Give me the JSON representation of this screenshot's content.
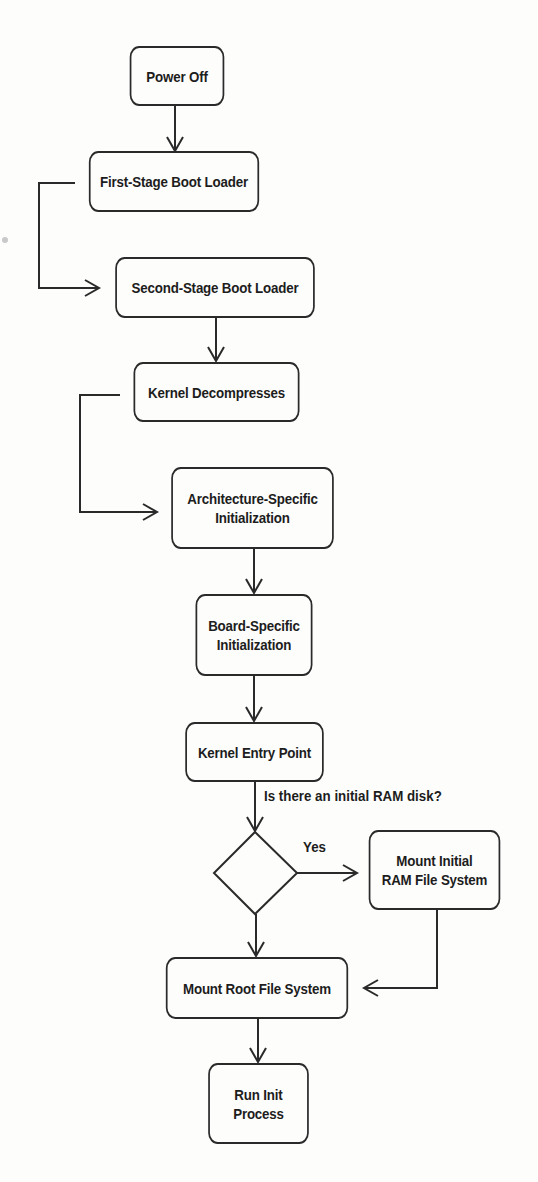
{
  "diagram": {
    "line_color": "#2a2a2a",
    "background": "#fdfdfc",
    "nodes": {
      "power_off": "Power Off",
      "first_stage": "First-Stage Boot Loader",
      "second_stage": "Second-Stage Boot Loader",
      "kernel_decompress": "Kernel Decompresses",
      "arch_init": "Architecture-Specific\nInitialization",
      "board_init": "Board-Specific\nInitialization",
      "kernel_entry": "Kernel Entry Point",
      "mount_initrd": "Mount Initial\nRAM File System",
      "mount_root": "Mount Root File System",
      "run_init": "Run Init\nProcess"
    },
    "decision": {
      "question": "Is there an initial RAM disk?",
      "yes_label": "Yes"
    },
    "edges": [
      {
        "from": "power_off",
        "to": "first_stage"
      },
      {
        "from": "first_stage",
        "to": "second_stage"
      },
      {
        "from": "second_stage",
        "to": "kernel_decompress"
      },
      {
        "from": "kernel_decompress",
        "to": "arch_init"
      },
      {
        "from": "arch_init",
        "to": "board_init"
      },
      {
        "from": "board_init",
        "to": "kernel_entry"
      },
      {
        "from": "kernel_entry",
        "to": "decision"
      },
      {
        "from": "decision",
        "to": "mount_initrd",
        "label": "Yes"
      },
      {
        "from": "decision",
        "to": "mount_root"
      },
      {
        "from": "mount_initrd",
        "to": "mount_root"
      },
      {
        "from": "mount_root",
        "to": "run_init"
      }
    ]
  }
}
